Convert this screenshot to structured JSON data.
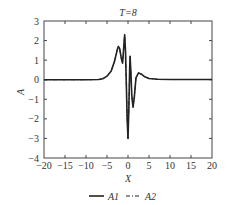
{
  "chart_data": {
    "type": "line",
    "title": "T=8",
    "xlabel": "X",
    "ylabel": "A",
    "xlim": [
      -20,
      20
    ],
    "ylim": [
      -4,
      3
    ],
    "xticks": [
      -20,
      -15,
      -10,
      -5,
      0,
      5,
      10,
      15,
      20
    ],
    "yticks": [
      -4,
      -3,
      -2,
      -1,
      0,
      1,
      2,
      3
    ],
    "xtick_labels": [
      "−20",
      "−15",
      "−10",
      "−5",
      "0",
      "5",
      "10",
      "15",
      "20"
    ],
    "ytick_labels": [
      "−4",
      "−3",
      "−2",
      "−1",
      "0",
      "1",
      "2",
      "3"
    ],
    "grid": false,
    "legend_position": "bottom",
    "series": [
      {
        "name": "A1",
        "style": "solid",
        "color": "#222222",
        "x": [
          -20,
          -10,
          -7,
          -6,
          -5,
          -4,
          -3.2,
          -2.6,
          -2.3,
          -2.0,
          -1.6,
          -1.3,
          -1.1,
          -0.8,
          -0.6,
          -0.4,
          -0.2,
          0.0,
          0.2,
          0.4,
          0.5,
          0.7,
          0.9,
          1.2,
          1.5,
          1.9,
          2.5,
          3.2,
          4,
          5,
          7,
          10,
          20
        ],
        "y": [
          0,
          0,
          0.01,
          0.05,
          0.18,
          0.45,
          0.95,
          1.5,
          1.7,
          1.6,
          1.1,
          0.85,
          1.4,
          2.3,
          1.5,
          -0.2,
          -2.0,
          -3.0,
          -1.5,
          0.6,
          1.2,
          0.3,
          -0.8,
          -1.4,
          -0.9,
          0.1,
          0.35,
          0.28,
          0.15,
          0.06,
          0.02,
          0.01,
          0.01
        ]
      },
      {
        "name": "A2",
        "style": "dash-dot",
        "color": "#222222",
        "x": [
          -20,
          -10,
          -7,
          -6,
          -5,
          -4,
          -3.2,
          -2.6,
          -2.3,
          -2.0,
          -1.6,
          -1.3,
          -1.1,
          -0.8,
          -0.6,
          -0.4,
          -0.2,
          0.0,
          0.2,
          0.4,
          0.5,
          0.7,
          0.9,
          1.2,
          1.5,
          1.9,
          2.5,
          3.2,
          4,
          5,
          7,
          10,
          20
        ],
        "y": [
          0,
          0,
          0.01,
          0.05,
          0.18,
          0.45,
          0.95,
          1.5,
          1.7,
          1.6,
          1.1,
          0.85,
          1.4,
          2.3,
          1.5,
          -0.2,
          -2.0,
          -3.0,
          -1.5,
          0.6,
          1.2,
          0.3,
          -0.8,
          -1.4,
          -0.9,
          0.1,
          0.35,
          0.28,
          0.15,
          0.06,
          0.02,
          0.01,
          0.01
        ]
      }
    ]
  },
  "legend": {
    "items": [
      {
        "label": "A1",
        "style": "solid"
      },
      {
        "label": "A2",
        "style": "dash-dot"
      }
    ]
  }
}
